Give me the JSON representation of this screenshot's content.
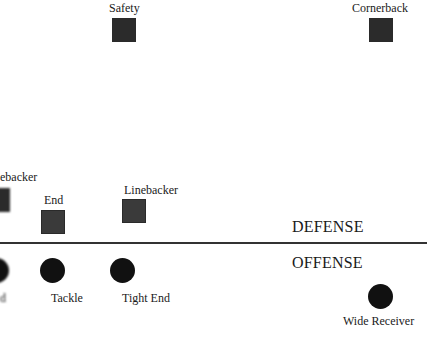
{
  "diagram": {
    "divider": {
      "defense_label": "DEFENSE",
      "offense_label": "OFFENSE"
    },
    "defense": [
      {
        "position": "Safety",
        "shape": "square"
      },
      {
        "position": "Cornerback",
        "shape": "square"
      },
      {
        "position": "Linebacker",
        "shape": "square",
        "label_visible": "ebacker",
        "partially_cropped": true
      },
      {
        "position": "End",
        "shape": "square"
      },
      {
        "position": "Linebacker",
        "shape": "square"
      }
    ],
    "offense": [
      {
        "position": "End",
        "shape": "circle",
        "label_visible": "d",
        "partially_cropped": true
      },
      {
        "position": "Tackle",
        "shape": "circle"
      },
      {
        "position": "Tight End",
        "shape": "circle"
      },
      {
        "position": "Wide Receiver",
        "shape": "circle"
      }
    ],
    "colors": {
      "marker": "#2b2b2b",
      "offense_marker": "#111111",
      "line": "#333333",
      "background": "#ffffff"
    }
  }
}
